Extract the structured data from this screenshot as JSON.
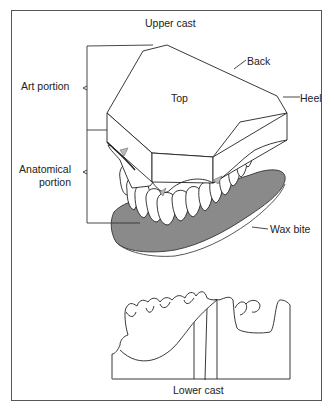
{
  "figure": {
    "title_upper": "Upper cast",
    "title_lower": "Lower cast",
    "labels": {
      "art_portion": "Art portion",
      "anatomical_portion_line1": "Anatomical",
      "anatomical_portion_line2": "portion",
      "top": "Top",
      "back": "Back",
      "heel": "Heel",
      "wax_bite": "Wax bite"
    },
    "colors": {
      "line": "#222222",
      "wax": "#8a8a8a",
      "frame": "#555555",
      "background": "#ffffff"
    }
  }
}
